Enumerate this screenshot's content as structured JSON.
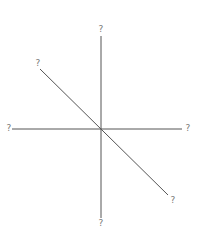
{
  "diagram": {
    "type": "axis-cross-with-diagonal",
    "note": "Axis-end labels are tiny CJK-like glyphs that are not legible at this resolution; label text below is a placeholder, not a transcription.",
    "colors": {
      "line": "#555555",
      "label": "#777777",
      "background": "#ffffff"
    },
    "center": [
      101,
      129
    ],
    "lines": [
      {
        "name": "vertical-axis",
        "from": [
          101,
          36
        ],
        "to": [
          101,
          218
        ]
      },
      {
        "name": "horizontal-axis",
        "from": [
          12,
          129
        ],
        "to": [
          182,
          129
        ]
      },
      {
        "name": "diagonal-line",
        "from": [
          40,
          69
        ],
        "to": [
          168,
          195
        ]
      }
    ],
    "labels": {
      "top": {
        "text": "?",
        "legible": false,
        "x": 101,
        "y": 29
      },
      "bottom": {
        "text": "?",
        "legible": false,
        "x": 101,
        "y": 223
      },
      "left": {
        "text": "?",
        "legible": false,
        "x": 9,
        "y": 128
      },
      "right": {
        "text": "?",
        "legible": false,
        "x": 188,
        "y": 128
      },
      "upper_left": {
        "text": "?",
        "legible": false,
        "x": 38,
        "y": 63
      },
      "lower_right": {
        "text": "?",
        "legible": false,
        "x": 173,
        "y": 200
      }
    }
  }
}
